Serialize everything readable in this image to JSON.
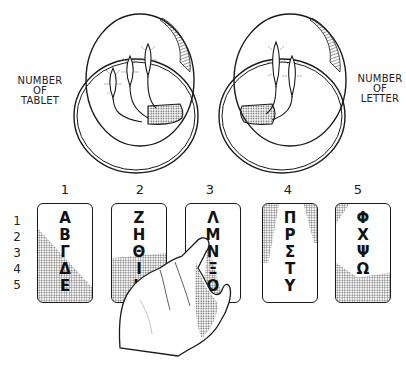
{
  "labels": {
    "left": [
      "NUMBER",
      "OF",
      "TABLET"
    ],
    "right": [
      "NUMBER",
      "OF",
      "LETTER"
    ]
  },
  "torches": {
    "left_vessel_count": 3,
    "right_vessel_count": 2
  },
  "column_numbers": [
    "1",
    "2",
    "3",
    "4",
    "5"
  ],
  "row_numbers": [
    "1",
    "2",
    "3",
    "4",
    "5"
  ],
  "tablets": [
    {
      "number": "1",
      "letters": [
        "Α",
        "Β",
        "Γ",
        "Δ",
        "Ε"
      ]
    },
    {
      "number": "2",
      "letters": [
        "Ζ",
        "Η",
        "Θ",
        "Ι",
        "Κ"
      ]
    },
    {
      "number": "3",
      "letters": [
        "Λ",
        "Μ",
        "Ν",
        "Ξ",
        "Ο"
      ]
    },
    {
      "number": "4",
      "letters": [
        "Π",
        "Ρ",
        "Σ",
        "Τ",
        "Υ"
      ]
    },
    {
      "number": "5",
      "letters": [
        "Φ",
        "Χ",
        "Ψ",
        "Ω",
        ""
      ]
    }
  ],
  "pointer": {
    "tablet": "3",
    "letter": "Μ"
  },
  "colors": {
    "ink": "#1a1a1a",
    "paper": "#ffffff",
    "stipple": "#555555"
  }
}
